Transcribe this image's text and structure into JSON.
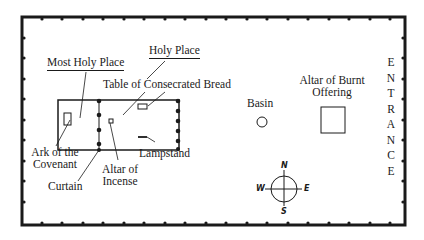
{
  "diagram": {
    "labels": {
      "holy_place": "Holy Place",
      "most_holy_place": "Most Holy Place",
      "table": "Table of Consecrated Bread",
      "basin": "Basin",
      "altar_burnt_1": "Altar of Burnt",
      "altar_burnt_2": "Offering",
      "ark_1": "Ark of the",
      "ark_2": "Covenant",
      "curtain": "Curtain",
      "altar_incense_1": "Altar of",
      "altar_incense_2": "Incense",
      "lampstand": "Lampstand"
    },
    "entrance_letters": [
      "E",
      "N",
      "T",
      "R",
      "A",
      "N",
      "C",
      "E"
    ],
    "compass": {
      "n": "N",
      "s": "S",
      "e": "E",
      "w": "W"
    },
    "colors": {
      "ink": "#1a1a1a",
      "background": "#ffffff"
    }
  }
}
